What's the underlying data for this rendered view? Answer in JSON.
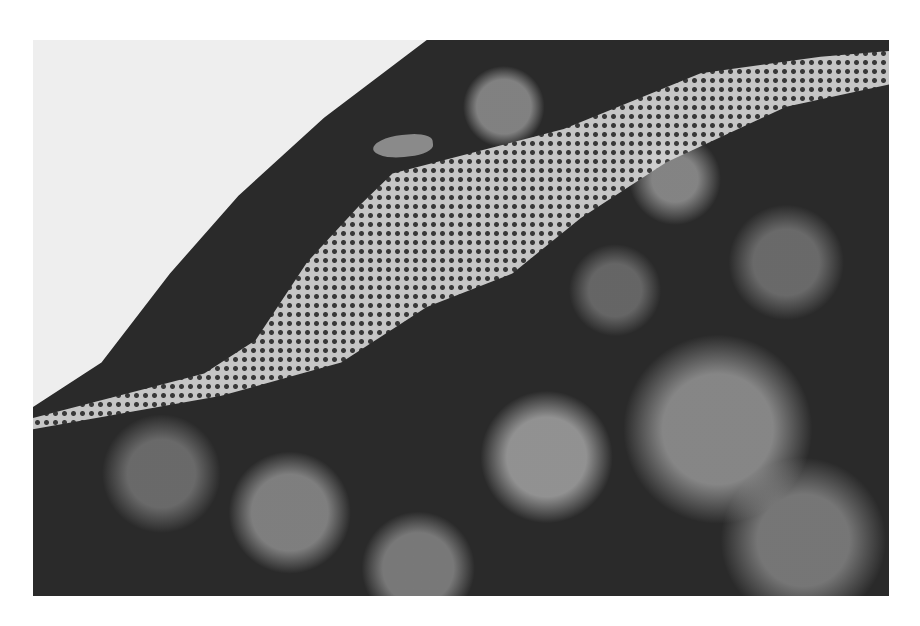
{
  "image": {
    "description": "Black and white photograph of a skeletonized, lace-like leaf on a branch with an insect perched near its upper edge, against dark foliage and a pale sky in the upper left",
    "colors": {
      "background": "#ffffff",
      "sky": "#eeeeee",
      "foliage_dark": "#2a2a2a",
      "leaf_light": "#d8d8d8"
    }
  }
}
